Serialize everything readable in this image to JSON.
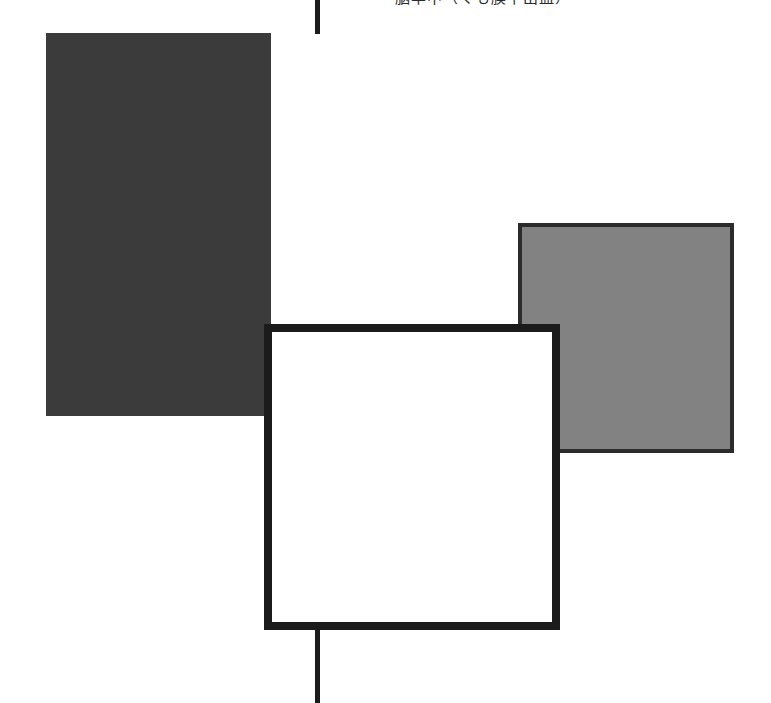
{
  "figure": {
    "caption_top": "脳卒中（くも膜下出血）",
    "background_color": "#ffffff",
    "width": 771,
    "height": 703
  },
  "shapes": {
    "dark_square": {
      "name": "dark filled square",
      "fill": "#3b3b3b",
      "x": 46,
      "y": 33,
      "width": 225,
      "height": 383
    },
    "gray_square": {
      "name": "gray filled square",
      "fill": "#828282",
      "stroke": "#2b2b2b",
      "x": 518,
      "y": 223,
      "width": 216,
      "height": 230
    },
    "white_square": {
      "name": "white outlined square",
      "fill": "#ffffff",
      "stroke": "#1b1b1b",
      "x": 264,
      "y": 324,
      "width": 296,
      "height": 306
    }
  },
  "connectors": {
    "top_stem": {
      "name": "top vertical connector",
      "color": "#1b1b1b",
      "x": 315,
      "y": 0,
      "width": 5,
      "height": 34
    },
    "bottom_stem": {
      "name": "bottom vertical connector",
      "color": "#1b1b1b",
      "x": 315,
      "y": 630,
      "width": 5,
      "height": 73
    }
  }
}
